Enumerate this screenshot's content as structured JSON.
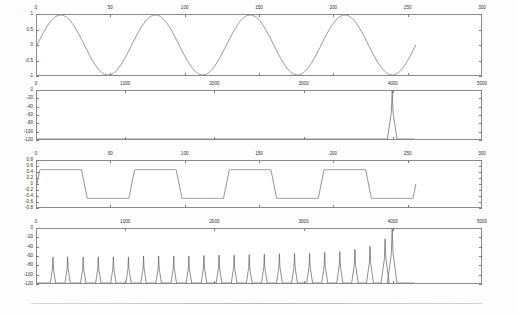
{
  "figure": {
    "title": "",
    "background": "#fdfdfd",
    "axis_color": "#8a8a8a",
    "line_color": "#6f6f6f"
  },
  "chart_data": [
    {
      "id": "plot1-time-sine",
      "type": "line",
      "title": "",
      "xlabel": "",
      "ylabel": "",
      "xlim": [
        0,
        300
      ],
      "ylim": [
        -1,
        1
      ],
      "xticks": [
        0,
        50,
        100,
        150,
        200,
        250,
        300
      ],
      "xticklabels": [
        "0",
        "50",
        "100",
        "150",
        "200",
        "250",
        "300"
      ],
      "yticks": [
        1,
        0.5,
        0,
        -0.5,
        -1
      ],
      "yticklabels": [
        "1",
        "0.5",
        "0",
        "-0.5",
        "-1"
      ],
      "grid": false,
      "legend": null,
      "series": [
        {
          "name": "sine",
          "description": "Pure sinusoid, amplitude 1, about 4 cycles over 0..256 samples, period approx 64 samples",
          "amplitude": 1.0,
          "period_samples": 64,
          "phase": 0,
          "x_start": 0,
          "x_end": 256
        }
      ]
    },
    {
      "id": "plot2-spectrum-sine",
      "type": "line",
      "title": "",
      "xlabel": "",
      "ylabel": "",
      "xlim": [
        0,
        5000
      ],
      "ylim": [
        -120,
        0
      ],
      "xticks": [
        0,
        1000,
        2000,
        3000,
        4000,
        5000
      ],
      "xticklabels": [
        "0",
        "1000",
        "2000",
        "3000",
        "4000",
        "5000"
      ],
      "yticks": [
        0,
        -20,
        -40,
        -60,
        -80,
        -100,
        -120
      ],
      "yticklabels": [
        "0",
        "-20",
        "-40",
        "-60",
        "-80",
        "-100",
        "-120"
      ],
      "grid": false,
      "legend": null,
      "series": [
        {
          "name": "magnitude-spectrum-dB",
          "description": "Single fundamental tone peak near 4000 with narrow skirts, noise floor at -120 dB",
          "peaks": [
            {
              "x": 4000,
              "y": 0
            }
          ],
          "noise_floor": -120
        }
      ]
    },
    {
      "id": "plot3-time-clipped",
      "type": "line",
      "title": "",
      "xlabel": "",
      "ylabel": "",
      "xlim": [
        0,
        300
      ],
      "ylim": [
        -0.8,
        0.8
      ],
      "xticks": [
        0,
        50,
        100,
        150,
        200,
        250,
        300
      ],
      "xticklabels": [
        "0",
        "50",
        "100",
        "150",
        "200",
        "250",
        "300"
      ],
      "yticks": [
        0.8,
        0.6,
        0.4,
        0.2,
        0,
        -0.2,
        -0.4,
        -0.6,
        -0.8
      ],
      "yticklabels": [
        "0.8",
        "0.6",
        "0.4",
        "0.2",
        "0",
        "-0.2",
        "-0.4",
        "-0.6",
        "-0.8"
      ],
      "grid": false,
      "legend": null,
      "series": [
        {
          "name": "clipped-sine",
          "description": "Hard-clipped / saturated sinusoid forming a trapezoidal wave, clipping levels approx +0.5 and -0.5, period approx 64 samples",
          "clip_high": 0.5,
          "clip_low": -0.5,
          "period_samples": 64,
          "x_start": 0,
          "x_end": 256
        }
      ]
    },
    {
      "id": "plot4-spectrum-clipped",
      "type": "line",
      "title": "",
      "xlabel": "",
      "ylabel": "",
      "xlim": [
        0,
        5000
      ],
      "ylim": [
        -120,
        0
      ],
      "xticks": [
        0,
        1000,
        2000,
        3000,
        4000,
        5000
      ],
      "xticklabels": [
        "0",
        "1000",
        "2000",
        "3000",
        "4000",
        "5000"
      ],
      "yticks": [
        0,
        -20,
        -40,
        -60,
        -80,
        -100,
        -120
      ],
      "yticklabels": [
        "0",
        "-20",
        "-40",
        "-60",
        "-80",
        "-100",
        "-120"
      ],
      "grid": false,
      "legend": null,
      "series": [
        {
          "name": "magnitude-spectrum-dB",
          "description": "Harmonic comb from clipping distortion; evenly spaced spikes rising toward the fundamental near 4000",
          "noise_floor": -120,
          "peaks": [
            {
              "x": 180,
              "y": -62
            },
            {
              "x": 345,
              "y": -62
            },
            {
              "x": 520,
              "y": -62
            },
            {
              "x": 690,
              "y": -62
            },
            {
              "x": 860,
              "y": -62
            },
            {
              "x": 1030,
              "y": -62
            },
            {
              "x": 1200,
              "y": -60
            },
            {
              "x": 1370,
              "y": -60
            },
            {
              "x": 1540,
              "y": -60
            },
            {
              "x": 1710,
              "y": -60
            },
            {
              "x": 1880,
              "y": -59
            },
            {
              "x": 2050,
              "y": -58
            },
            {
              "x": 2220,
              "y": -58
            },
            {
              "x": 2390,
              "y": -57
            },
            {
              "x": 2560,
              "y": -56
            },
            {
              "x": 2730,
              "y": -55
            },
            {
              "x": 2900,
              "y": -54
            },
            {
              "x": 3070,
              "y": -54
            },
            {
              "x": 3240,
              "y": -52
            },
            {
              "x": 3410,
              "y": -50
            },
            {
              "x": 3580,
              "y": -45
            },
            {
              "x": 3750,
              "y": -38
            },
            {
              "x": 3920,
              "y": -22
            },
            {
              "x": 4000,
              "y": 0
            }
          ]
        }
      ]
    }
  ]
}
